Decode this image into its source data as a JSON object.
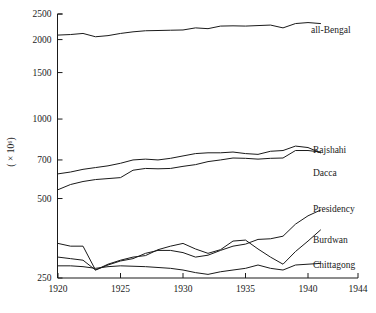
{
  "chart_data": {
    "type": "line",
    "title": "",
    "subtitle": "",
    "xlabel": "",
    "ylabel": "( × 10⁶)",
    "yscale": "log",
    "ylim": [
      250,
      2500
    ],
    "xlim": [
      1920,
      1944
    ],
    "grid": false,
    "legend_position": "right-inline-labels",
    "x_ticks": [
      "1920",
      "1925",
      "1930",
      "1935",
      "1940",
      "1944"
    ],
    "x_tick_values": [
      1920,
      1925,
      1930,
      1935,
      1940,
      1944
    ],
    "y_ticks": [
      "250",
      "500",
      "700",
      "1000",
      "1500",
      "2000",
      "2500"
    ],
    "y_tick_values": [
      250,
      500,
      700,
      1000,
      1500,
      2000,
      2500
    ],
    "series": [
      {
        "name": "all-Bengal",
        "label": "all-Bengal",
        "x": [
          1920,
          1921,
          1922,
          1923,
          1924,
          1925,
          1926,
          1927,
          1928,
          1929,
          1930,
          1931,
          1932,
          1933,
          1934,
          1935,
          1936,
          1937,
          1938,
          1939,
          1940,
          1941
        ],
        "values": [
          2080,
          2090,
          2110,
          2050,
          2070,
          2110,
          2140,
          2160,
          2165,
          2170,
          2175,
          2215,
          2200,
          2250,
          2255,
          2250,
          2260,
          2270,
          2215,
          2300,
          2320,
          2300
        ]
      },
      {
        "name": "Rajshahi",
        "label": "Rajshahi",
        "x": [
          1920,
          1921,
          1922,
          1923,
          1924,
          1925,
          1926,
          1927,
          1928,
          1929,
          1930,
          1931,
          1932,
          1933,
          1934,
          1935,
          1936,
          1937,
          1938,
          1939,
          1940,
          1941
        ],
        "values": [
          620,
          630,
          645,
          655,
          665,
          680,
          700,
          705,
          700,
          710,
          725,
          740,
          745,
          745,
          750,
          740,
          735,
          755,
          760,
          790,
          780,
          745
        ]
      },
      {
        "name": "Dacca",
        "label": "Dacca",
        "x": [
          1920,
          1921,
          1922,
          1923,
          1924,
          1925,
          1926,
          1927,
          1928,
          1929,
          1930,
          1931,
          1932,
          1933,
          1934,
          1935,
          1936,
          1937,
          1938,
          1939,
          1940,
          1941
        ],
        "values": [
          540,
          565,
          580,
          590,
          595,
          600,
          640,
          650,
          648,
          650,
          662,
          672,
          690,
          700,
          712,
          710,
          705,
          710,
          712,
          760,
          760,
          750
        ]
      },
      {
        "name": "Presidency",
        "label": "Presidency",
        "x": [
          1920,
          1921,
          1922,
          1923,
          1924,
          1925,
          1926,
          1927,
          1928,
          1929,
          1930,
          1931,
          1932,
          1933,
          1934,
          1935,
          1936,
          1937,
          1938,
          1939,
          1940,
          1941
        ],
        "values": [
          300,
          296,
          292,
          268,
          280,
          290,
          296,
          310,
          318,
          318,
          312,
          300,
          305,
          318,
          330,
          336,
          350,
          352,
          360,
          400,
          430,
          452
        ]
      },
      {
        "name": "Burdwan",
        "label": "Burdwan",
        "x": [
          1920,
          1921,
          1922,
          1923,
          1924,
          1925,
          1926,
          1927,
          1928,
          1929,
          1930,
          1931,
          1932,
          1933,
          1934,
          1935,
          1936,
          1937,
          1938,
          1939,
          1940,
          1941
        ],
        "values": [
          338,
          330,
          330,
          268,
          282,
          292,
          300,
          304,
          320,
          330,
          338,
          322,
          310,
          320,
          345,
          348,
          322,
          300,
          282,
          315,
          345,
          380
        ]
      },
      {
        "name": "Chittagong",
        "label": "Chittagong",
        "x": [
          1920,
          1921,
          1922,
          1923,
          1924,
          1925,
          1926,
          1927,
          1928,
          1929,
          1930,
          1931,
          1932,
          1933,
          1934,
          1935,
          1936,
          1937,
          1938,
          1939,
          1940,
          1941
        ],
        "values": [
          278,
          278,
          276,
          272,
          276,
          278,
          277,
          276,
          274,
          272,
          268,
          262,
          258,
          264,
          268,
          272,
          280,
          272,
          268,
          280,
          282,
          284
        ]
      }
    ],
    "series_label_positions": [
      {
        "name": "all-Bengal",
        "x": 311,
        "y": 33
      },
      {
        "name": "Rajshahi",
        "x": 313,
        "y": 153
      },
      {
        "name": "Dacca",
        "x": 313,
        "y": 176
      },
      {
        "name": "Presidency",
        "x": 313,
        "y": 212
      },
      {
        "name": "Burdwan",
        "x": 313,
        "y": 243
      },
      {
        "name": "Chittagong",
        "x": 313,
        "y": 268
      }
    ]
  }
}
